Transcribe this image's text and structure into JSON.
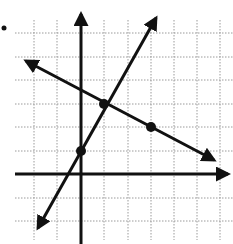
{
  "figure": {
    "type": "coordinate-graph",
    "bullet_marker": "•",
    "grid": {
      "x_min": -2,
      "x_max": 6,
      "y_min": -2,
      "y_max": 6,
      "spacing_px": 23.4,
      "style": "dotted"
    },
    "axes": {
      "x_axis": "horizontal with right arrow",
      "y_axis": "vertical with up arrow"
    },
    "lines": [
      {
        "name": "line-a",
        "equation": "y = 2x + 1",
        "slope": 2,
        "intercept": 1,
        "points": [
          [
            0,
            1
          ],
          [
            1,
            3
          ]
        ]
      },
      {
        "name": "line-b",
        "equation": "y = -0.5x + 3.5",
        "slope": -0.5,
        "intercept": 3.5,
        "points": [
          [
            1,
            3
          ],
          [
            3,
            2
          ]
        ]
      }
    ],
    "marked_points": [
      {
        "label": "(0, 1)",
        "x": 0,
        "y": 1
      },
      {
        "label": "(1, 3)",
        "x": 1,
        "y": 3
      },
      {
        "label": "(3, 2)",
        "x": 3,
        "y": 2
      }
    ],
    "colors": {
      "ink": "#111111",
      "grid": "#9a9a9a",
      "background": "#ffffff"
    }
  }
}
